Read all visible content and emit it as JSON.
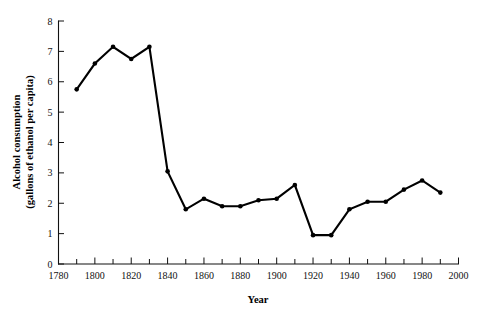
{
  "figure": {
    "background_color": "#ffffff",
    "line_color": "#000000",
    "axis_color": "#111111",
    "x_axis_title": "Year",
    "y_axis_title_line1": "Alcohol consumption",
    "y_axis_title_line2": "(gallons of ethanol per capita)"
  },
  "chart_data": {
    "type": "line",
    "title": "",
    "xlabel": "Year",
    "ylabel": "Alcohol consumption (gallons of ethanol per capita)",
    "xlim": [
      1780,
      2000
    ],
    "ylim": [
      0,
      8
    ],
    "grid": false,
    "legend": null,
    "x_major_ticks": [
      1780,
      1800,
      1820,
      1840,
      1860,
      1880,
      1900,
      1920,
      1940,
      1960,
      1980,
      2000
    ],
    "x_minor_ticks": [
      1790,
      1810,
      1830,
      1850,
      1870,
      1890,
      1910,
      1930,
      1950,
      1970,
      1990
    ],
    "x_tick_labels": [
      "1780",
      "1800",
      "1820",
      "1840",
      "1860",
      "1880",
      "1900",
      "1920",
      "1940",
      "1960",
      "1980",
      "2000"
    ],
    "y_major_ticks": [
      0,
      1,
      2,
      3,
      4,
      5,
      6,
      7,
      8
    ],
    "y_tick_labels": [
      "0",
      "1",
      "2",
      "3",
      "4",
      "5",
      "6",
      "7",
      "8"
    ],
    "series": [
      {
        "name": "Alcohol consumption",
        "marker": "filled-circle",
        "x": [
          1790,
          1800,
          1810,
          1820,
          1830,
          1840,
          1850,
          1860,
          1870,
          1880,
          1890,
          1900,
          1910,
          1920,
          1930,
          1940,
          1950,
          1960,
          1970,
          1980,
          1990
        ],
        "y": [
          5.75,
          6.6,
          7.15,
          6.75,
          7.15,
          3.05,
          1.8,
          2.15,
          1.9,
          1.9,
          2.1,
          2.15,
          2.6,
          0.95,
          0.95,
          1.8,
          2.05,
          2.05,
          2.45,
          2.75,
          2.35
        ]
      }
    ]
  }
}
